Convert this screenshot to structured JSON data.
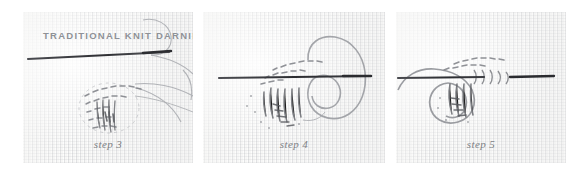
{
  "figure": {
    "title_overlay": "TRADITIONAL KNIT DARNING",
    "background_color": "#ffffff",
    "fabric_color": "#fcfcfb",
    "thread_color": "#8b8d92",
    "needle_color": "#3a3b3f",
    "caption_color": "#6f7176",
    "title_color": "#8e9196"
  },
  "panels": [
    {
      "id": "step-3",
      "caption": "step 3",
      "alt": "Knit fabric with a long straight darning needle passing horizontally near the top, a woven oval darn patch below it, and loose yarn tails curving off to the right.",
      "has_title_overlay": true
    },
    {
      "id": "step-4",
      "caption": "step 4",
      "alt": "Knit fabric with a horizontal darning needle through a partially woven darn, and a large loop of yarn arcing over and around the right side of the needle.",
      "has_title_overlay": false
    },
    {
      "id": "step-5",
      "caption": "step 5",
      "alt": "Knit fabric with the darning needle drawn through; the yarn loop is tightened around the woven darn area and the needle tip exits to the right.",
      "has_title_overlay": false
    }
  ]
}
